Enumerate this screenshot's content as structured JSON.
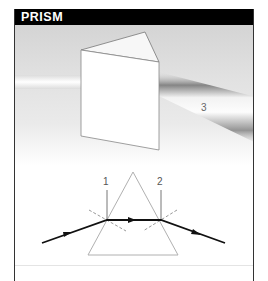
{
  "header": {
    "title": "PRISM"
  },
  "photo": {
    "description": "Photograph of glass prism splitting white light into a spectrum",
    "beam_label": "3"
  },
  "diagram": {
    "normal_labels": [
      "1",
      "2"
    ],
    "elements": [
      "triangle-prism",
      "incident-ray",
      "refracted-ray",
      "emergent-ray",
      "normal-1",
      "normal-2"
    ]
  },
  "colors": {
    "header_bg": "#000000",
    "header_text": "#ffffff",
    "ray": "#111111",
    "prism_outline": "#aaaaaa",
    "normal_dashed": "#999999"
  }
}
